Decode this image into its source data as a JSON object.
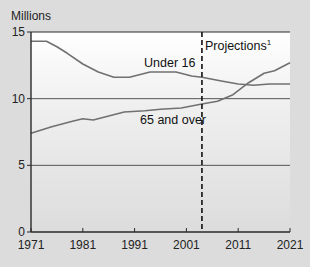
{
  "chart_data": {
    "type": "line",
    "title": "",
    "xlabel": "",
    "ylabel": "Millions",
    "xlim": [
      1971,
      2021
    ],
    "ylim": [
      0,
      15
    ],
    "x_ticks": [
      1971,
      1981,
      1991,
      2001,
      2011,
      2021
    ],
    "y_ticks": [
      0,
      5,
      10,
      15
    ],
    "grid": "horizontal at 5 and 10",
    "projection_start": 2004,
    "annotations": [
      {
        "text": "Projections",
        "superscript": "1",
        "x": 2004
      }
    ],
    "series": [
      {
        "name": "Under 16",
        "x": [
          1971,
          1974,
          1976,
          1978,
          1981,
          1984,
          1987,
          1990,
          1994,
          1999,
          2002,
          2004,
          2008,
          2011,
          2014,
          2017,
          2021
        ],
        "values": [
          14.3,
          14.3,
          13.9,
          13.4,
          12.6,
          12.0,
          11.6,
          11.6,
          12.0,
          12.0,
          11.7,
          11.6,
          11.3,
          11.1,
          11.0,
          11.1,
          11.1
        ]
      },
      {
        "name": "65 and over",
        "x": [
          1971,
          1975,
          1979,
          1981,
          1983,
          1986,
          1989,
          1993,
          1996,
          2000,
          2004,
          2007,
          2010,
          2013,
          2016,
          2018,
          2021
        ],
        "values": [
          7.4,
          7.9,
          8.3,
          8.5,
          8.4,
          8.7,
          9.0,
          9.1,
          9.2,
          9.3,
          9.6,
          9.8,
          10.3,
          11.2,
          11.9,
          12.1,
          12.7
        ]
      }
    ]
  },
  "labels": {
    "unit": "Millions",
    "projections": "Projections",
    "projections_sup": "1",
    "under16": "Under 16",
    "over65": "65 and over"
  },
  "colors": {
    "line": "#707070",
    "axis": "#2a2a2a",
    "grid": "#555555",
    "background": "#dcdcdc"
  }
}
